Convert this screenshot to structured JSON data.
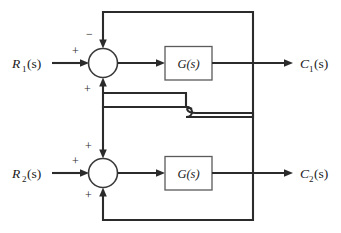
{
  "figure": {
    "type": "control-system-block-diagram",
    "background_color": "#ffffff",
    "line_color": "#2b2b2b",
    "box_fill": "#ffffff",
    "box_stroke": "#5a5a5a"
  },
  "labels": {
    "input_1": {
      "symbol": "R",
      "subscript": "1",
      "argument": "(s)",
      "full": "R1(s)"
    },
    "input_2": {
      "symbol": "R",
      "subscript": "2",
      "argument": "(s)",
      "full": "R2(s)"
    },
    "output_1": {
      "symbol": "C",
      "subscript": "1",
      "argument": "(s)",
      "full": "C1(s)"
    },
    "output_2": {
      "symbol": "C",
      "subscript": "2",
      "argument": "(s)",
      "full": "C2(s)"
    },
    "block_1": "G(s)",
    "block_2": "G(s)"
  },
  "summing_junctions": [
    {
      "id": "sum-top",
      "signs": {
        "top": "−",
        "left": "+",
        "bottom": "+"
      }
    },
    {
      "id": "sum-bottom",
      "signs": {
        "top": "+",
        "left": "+",
        "bottom": "+"
      }
    }
  ],
  "signs": {
    "minus": "−",
    "plus": "+"
  },
  "branches": {
    "top_loop": "C1(s) fed back to top summing junction top input (negative)",
    "bottom_loop": "C2(s) fed back to bottom summing junction bottom input (positive)",
    "cross_1": "C1(s) branch crosses down to bottom summing junction top input (positive)",
    "cross_2": "C2(s) branch crosses up to top summing junction bottom input (positive)",
    "crossover_style": "line-hop (jump) where the two cross-coupling wires intersect"
  }
}
